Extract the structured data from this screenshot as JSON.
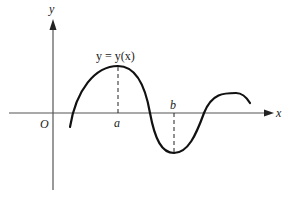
{
  "diagram": {
    "type": "function-graph",
    "colors": {
      "curve": "#111111",
      "axis": "#555555",
      "background": "#ffffff"
    },
    "labels": {
      "y_axis": "y",
      "x_axis": "x",
      "origin": "O",
      "point_a": "a",
      "point_b": "b",
      "equation": "y = y(x)"
    },
    "features": [
      {
        "name": "local-maximum",
        "at": "a"
      },
      {
        "name": "local-minimum",
        "at": "b"
      }
    ]
  }
}
